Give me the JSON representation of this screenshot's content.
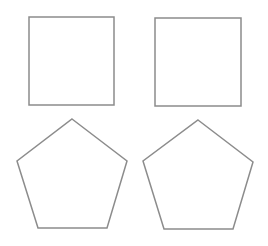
{
  "canvas": {
    "width": 268,
    "height": 246,
    "background": "#ffffff"
  },
  "style": {
    "stroke": "#8c8c8c",
    "stroke_width": 1.5,
    "fill": "#ffffff"
  },
  "shapes": [
    {
      "id": "square-top-left",
      "type": "square",
      "points": "29,17 114,17 114,105 29,105"
    },
    {
      "id": "square-top-right",
      "type": "square",
      "points": "155,18 241,18 241,106 155,106"
    },
    {
      "id": "pentagon-bottom-left",
      "type": "pentagon",
      "points": "72,119 127,161 107,228 38,228 17,161"
    },
    {
      "id": "pentagon-bottom-right",
      "type": "pentagon",
      "points": "198,120 253,162 233,229 164,229 143,161"
    }
  ]
}
